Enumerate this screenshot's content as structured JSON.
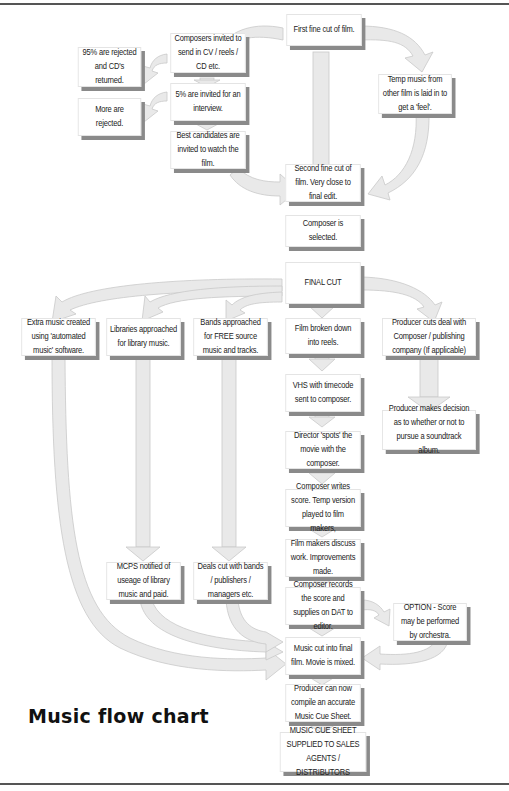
{
  "title": "Music flow chart",
  "colors": {
    "arrow_fill": "#e8e8e8",
    "arrow_stroke": "#c8c8c8",
    "box_shadow": "#8a8a8a",
    "rule": "#555555"
  },
  "nodes": {
    "first_cut": "First fine cut of film.",
    "composers_invited": "Composers invited to send in CV / reels / CD etc.",
    "rejected_95": "95% are rejected and CD's returned.",
    "invited_5": "5% are invited for an interview.",
    "more_rejected": "More are rejected.",
    "best_candidates": "Best candidates are invited to watch the film.",
    "temp_music": "Temp music from other film is laid in to get a 'feel'.",
    "second_cut": "Second fine cut of film. Very close to final edit.",
    "composer_selected": "Composer is selected.",
    "final_cut": "FINAL CUT",
    "extra_music": "Extra music created using 'automated music' software.",
    "libraries": "Libraries approached for library music.",
    "bands": "Bands approached for FREE source music and tracks.",
    "reels": "Film broken down into reels.",
    "producer_deal": "Producer cuts deal with Composer / publishing company (If applicable)",
    "vhs": "VHS with timecode sent to composer.",
    "soundtrack_decision": "Producer makes decision as to whether or not to pursue a soundtrack album.",
    "spots": "Director 'spots' the movie with the composer.",
    "writes_score": "Composer writes score. Temp version played to film makers,",
    "discuss": "Film makers discuss work. Improvements made.",
    "mcps": "MCPS notified of useage of library music and paid.",
    "deals_bands": "Deals cut with bands / publishers / managers etc.",
    "records": "Composer records the score and supplies on DAT to editor.",
    "option_orchestra": "OPTION - Score may be performed by orchestra.",
    "music_cut": "Music cut into final film. Movie is mixed.",
    "cue_sheet_compile": "Producer can now compile an accurate Music Cue Sheet.",
    "cue_sheet_supplied": "MUSIC CUE SHEET SUPPLIED TO SALES AGENTS / DISTRIBUTORS"
  }
}
